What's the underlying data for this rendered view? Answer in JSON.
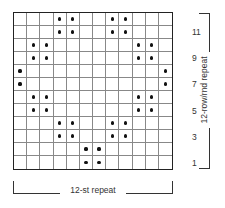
{
  "chart": {
    "type": "knitting-chart",
    "columns": 12,
    "rows": 12,
    "symbol": "dot",
    "symbol_color": "#111111",
    "grid_rows_top_to_bottom": [
      {
        "row": 12,
        "dots": [
          4,
          5,
          8,
          9
        ]
      },
      {
        "row": 11,
        "dots": [
          4,
          5,
          8,
          9
        ]
      },
      {
        "row": 10,
        "dots": [
          2,
          3,
          10,
          11
        ]
      },
      {
        "row": 9,
        "dots": [
          2,
          3,
          10,
          11
        ]
      },
      {
        "row": 8,
        "dots": [
          1,
          12
        ]
      },
      {
        "row": 7,
        "dots": [
          1,
          12
        ]
      },
      {
        "row": 6,
        "dots": [
          2,
          3,
          10,
          11
        ]
      },
      {
        "row": 5,
        "dots": [
          2,
          3,
          10,
          11
        ]
      },
      {
        "row": 4,
        "dots": [
          4,
          5,
          8,
          9
        ]
      },
      {
        "row": 3,
        "dots": [
          4,
          5,
          8,
          9
        ]
      },
      {
        "row": 2,
        "dots": [
          6,
          7
        ]
      },
      {
        "row": 1,
        "dots": [
          6,
          7
        ]
      }
    ]
  },
  "row_labels": [
    {
      "label": "11",
      "row": 11
    },
    {
      "label": "9",
      "row": 9
    },
    {
      "label": "7",
      "row": 7
    },
    {
      "label": "5",
      "row": 5
    },
    {
      "label": "3",
      "row": 3
    },
    {
      "label": "1",
      "row": 1
    }
  ],
  "vertical_repeat_label": "12-row/rnd repeat",
  "horizontal_repeat_label": "12-st repeat"
}
